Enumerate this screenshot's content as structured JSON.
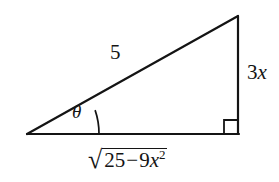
{
  "figure": {
    "type": "right-triangle-diagram",
    "background_color": "#ffffff",
    "stroke_color": "#141414",
    "labels": {
      "hypotenuse": "5",
      "opposite_leading": "3",
      "opposite_variable": "x",
      "angle": "θ",
      "adjacent_radical_sign": "√",
      "adjacent_radicand_first": "25",
      "adjacent_radicand_operator": "−",
      "adjacent_radicand_second": "9",
      "adjacent_radicand_variable": "x",
      "adjacent_radicand_exponent": "2"
    },
    "geometry": {
      "left_vertex": [
        27,
        134
      ],
      "right_vertex": [
        238,
        134
      ],
      "top_vertex": [
        238,
        16
      ],
      "right_angle_marker_size": 14,
      "angle_arc_radius": 72
    }
  }
}
